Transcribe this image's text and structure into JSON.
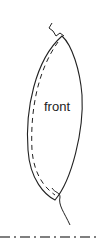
{
  "diagram": {
    "piece_label": "front",
    "colors": {
      "line": "#222222",
      "background": "#ffffff"
    }
  }
}
